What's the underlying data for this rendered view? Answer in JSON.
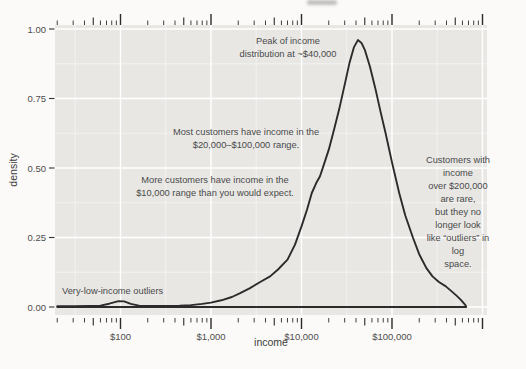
{
  "figure": {
    "page_bg": "#fbfaf8",
    "panel_bg": "#e8e7e4",
    "grid_major_color": "#ffffff",
    "grid_minor_color": "#ffffff",
    "curve_color": "#2b2b2b",
    "tick_mark_color": "#2a2a2a",
    "tick_label_color": "#4d4d4d",
    "axis_title_color": "#3c3c3c",
    "annotation_color": "#4a4a4a"
  },
  "chart_data": {
    "type": "area",
    "subtype": "density-curve",
    "title": "",
    "xlabel": "income",
    "ylabel": "density",
    "x_scale": "log10",
    "xlim": [
      19,
      1120000
    ],
    "ylim": [
      -0.025,
      1.015
    ],
    "grid": true,
    "legend": "none",
    "x_ticks": [
      {
        "label": "$100",
        "value": 100
      },
      {
        "label": "$1,000",
        "value": 1000
      },
      {
        "label": "$10,000",
        "value": 10000
      },
      {
        "label": "$100,000",
        "value": 100000
      }
    ],
    "x_gridlines_major": [
      100,
      1000,
      10000,
      100000,
      1000000
    ],
    "x_gridlines_minor": [
      31.6,
      316,
      3160,
      31600,
      316000
    ],
    "y_ticks": [
      {
        "label": "0.00",
        "value": 0.0
      },
      {
        "label": "0.25",
        "value": 0.25
      },
      {
        "label": "0.50",
        "value": 0.5
      },
      {
        "label": "0.75",
        "value": 0.75
      },
      {
        "label": "1.00",
        "value": 1.0
      }
    ],
    "y_gridlines_minor": [
      0.125,
      0.375,
      0.625,
      0.875
    ],
    "log_tick_marks": {
      "sides": "top-bottom",
      "min": 20,
      "max": 1000000
    },
    "series": [
      {
        "name": "income density",
        "points": [
          [
            20,
            0.003
          ],
          [
            30,
            0.003
          ],
          [
            45,
            0.004
          ],
          [
            60,
            0.005
          ],
          [
            75,
            0.012
          ],
          [
            95,
            0.021
          ],
          [
            110,
            0.02
          ],
          [
            130,
            0.011
          ],
          [
            160,
            0.005
          ],
          [
            200,
            0.004
          ],
          [
            300,
            0.004
          ],
          [
            450,
            0.005
          ],
          [
            600,
            0.007
          ],
          [
            800,
            0.011
          ],
          [
            1000,
            0.016
          ],
          [
            1300,
            0.024
          ],
          [
            1700,
            0.036
          ],
          [
            2100,
            0.05
          ],
          [
            2700,
            0.068
          ],
          [
            3500,
            0.09
          ],
          [
            4500,
            0.11
          ],
          [
            5500,
            0.135
          ],
          [
            7000,
            0.17
          ],
          [
            8500,
            0.225
          ],
          [
            10000,
            0.29
          ],
          [
            11500,
            0.35
          ],
          [
            13000,
            0.41
          ],
          [
            14500,
            0.445
          ],
          [
            16000,
            0.47
          ],
          [
            18000,
            0.52
          ],
          [
            20000,
            0.565
          ],
          [
            23000,
            0.64
          ],
          [
            26000,
            0.71
          ],
          [
            30000,
            0.8
          ],
          [
            34000,
            0.88
          ],
          [
            38000,
            0.935
          ],
          [
            42000,
            0.96
          ],
          [
            46000,
            0.95
          ],
          [
            50000,
            0.925
          ],
          [
            57000,
            0.865
          ],
          [
            65000,
            0.79
          ],
          [
            75000,
            0.7
          ],
          [
            85000,
            0.625
          ],
          [
            100000,
            0.52
          ],
          [
            120000,
            0.41
          ],
          [
            140000,
            0.33
          ],
          [
            170000,
            0.25
          ],
          [
            200000,
            0.19
          ],
          [
            240000,
            0.14
          ],
          [
            280000,
            0.11
          ],
          [
            330000,
            0.09
          ],
          [
            390000,
            0.075
          ],
          [
            450000,
            0.058
          ],
          [
            520000,
            0.04
          ],
          [
            580000,
            0.025
          ],
          [
            620000,
            0.014
          ],
          [
            650000,
            0.006
          ],
          [
            660000,
            0.0
          ]
        ]
      }
    ],
    "annotations": {
      "peak": {
        "text": "Peak of income\ndistribution at ~$40,000",
        "cx": 288,
        "cy": 48,
        "align": "center"
      },
      "most": {
        "text": "Most customers have income in the\n$20,000–$100,000 range.",
        "cx": 246,
        "cy": 139,
        "align": "center"
      },
      "more": {
        "text": "More customers have income in the\n$10,000 range than you would expect.",
        "cx": 215,
        "cy": 187,
        "align": "center"
      },
      "rare": {
        "text": "Customers with income\nover $200,000 are rare,\nbut they no longer look\nlike “outliers” in log\nspace.",
        "cx": 458,
        "cy": 212,
        "align": "center"
      },
      "outliers": {
        "text": "Very-low-income outliers",
        "cx": 62,
        "cy": 291,
        "align": "left"
      }
    }
  }
}
